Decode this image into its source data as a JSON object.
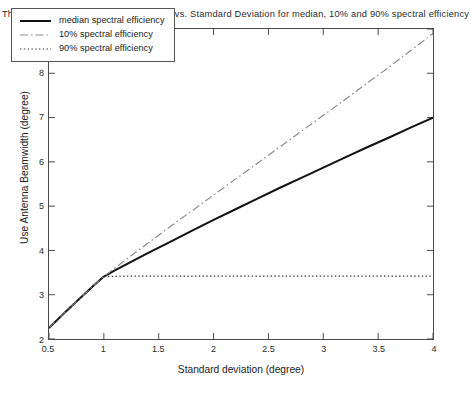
{
  "chart_data": {
    "type": "line",
    "title": "The Optimum User Antenna Beamwidth vs. Stamdard Deviation for median, 10% and 90% spectral efficiency",
    "xlabel": "Standard deviation (degree)",
    "ylabel": "Use Antenna Beamwidth (degree)",
    "xlim": [
      0.5,
      4
    ],
    "ylim": [
      2,
      9
    ],
    "xticks": [
      0.5,
      1,
      1.5,
      2,
      2.5,
      3,
      3.5,
      4
    ],
    "xticklabels": [
      "0.5",
      "1",
      "1.5",
      "2",
      "2.5",
      "3",
      "3.5",
      "4"
    ],
    "yticks": [
      2,
      3,
      4,
      5,
      6,
      7,
      8,
      9
    ],
    "yticklabels": [
      "2",
      "3",
      "4",
      "5",
      "6",
      "7",
      "8",
      "9"
    ],
    "grid": false,
    "legend_position": "upper left",
    "series": [
      {
        "name": "median spectral efficiency",
        "style": "solid",
        "color": "#111111",
        "width": 2.0,
        "x": [
          0.5,
          0.6,
          0.7,
          0.8,
          0.9,
          1.0,
          1.1,
          1.2,
          1.4,
          1.6,
          1.8,
          2.0,
          2.2,
          2.4,
          2.6,
          2.8,
          3.0,
          3.2,
          3.4,
          3.6,
          3.8,
          4.0
        ],
        "y": [
          2.25,
          2.49,
          2.73,
          2.96,
          3.19,
          3.41,
          3.55,
          3.68,
          3.94,
          4.19,
          4.44,
          4.69,
          4.93,
          5.17,
          5.41,
          5.64,
          5.87,
          6.1,
          6.33,
          6.55,
          6.78,
          7.0
        ]
      },
      {
        "name": "10% spectral efficiency",
        "style": "dashdot",
        "color": "#8c8c8c",
        "width": 1.2,
        "x": [
          0.5,
          0.6,
          0.7,
          0.8,
          0.9,
          1.0,
          1.1,
          1.2,
          1.4,
          1.6,
          1.8,
          2.0,
          2.2,
          2.4,
          2.6,
          2.8,
          3.0,
          3.2,
          3.4,
          3.6,
          3.8,
          4.0
        ],
        "y": [
          2.25,
          2.49,
          2.73,
          2.96,
          3.19,
          3.41,
          3.6,
          3.79,
          4.16,
          4.53,
          4.89,
          5.25,
          5.61,
          5.97,
          6.33,
          6.69,
          7.05,
          7.41,
          7.78,
          8.14,
          8.52,
          8.9
        ]
      },
      {
        "name": "90% spectral efficiency",
        "style": "dotted",
        "color": "#333333",
        "width": 1.2,
        "x": [
          0.5,
          0.6,
          0.7,
          0.8,
          0.9,
          1.0,
          1.2,
          1.5,
          2.0,
          2.5,
          3.0,
          3.5,
          4.0
        ],
        "y": [
          2.25,
          2.49,
          2.73,
          2.96,
          3.19,
          3.41,
          3.42,
          3.42,
          3.42,
          3.42,
          3.42,
          3.42,
          3.42
        ]
      }
    ]
  },
  "legend": {
    "entries": [
      {
        "label": "median spectral efficiency"
      },
      {
        "label": "10% spectral efficiency"
      },
      {
        "label": "90% spectral efficiency"
      }
    ]
  }
}
